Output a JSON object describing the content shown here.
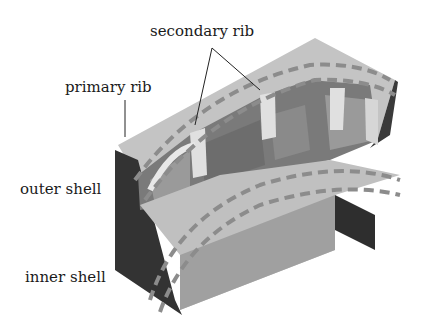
{
  "diagram": {
    "type": "isometric cutaway of curved shell structure",
    "labels": {
      "secondary_rib": "secondary rib",
      "primary_rib": "primary rib",
      "outer_shell": "outer shell",
      "inner_shell": "inner shell"
    },
    "colors": {
      "top_face": "#c4c4c4",
      "front_face": "#a0a0a0",
      "dark_face": "#3a3a3a",
      "mid_face": "#7a7a7a",
      "rib_light": "#e0e0e0",
      "dashed_curve": "#8c8c8c",
      "leader_line": "#222222"
    }
  }
}
